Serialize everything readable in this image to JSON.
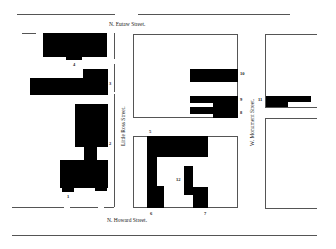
{
  "streets": {
    "north": "N. Eutaw Street.",
    "south": "N. Howard Street.",
    "west_mid": "Little Ross Street.",
    "east_mid": "W. Monument Street."
  },
  "building_numbers": {
    "n1": "1",
    "n2": "2",
    "n3": "3",
    "n4": "4",
    "n5": "5",
    "n6": "6",
    "n7": "7",
    "n8": "8",
    "n9": "9",
    "n10": "10",
    "n11": "11",
    "n12": "12"
  },
  "colors": {
    "building": "#000000",
    "line": "#555555",
    "background": "#ffffff"
  }
}
